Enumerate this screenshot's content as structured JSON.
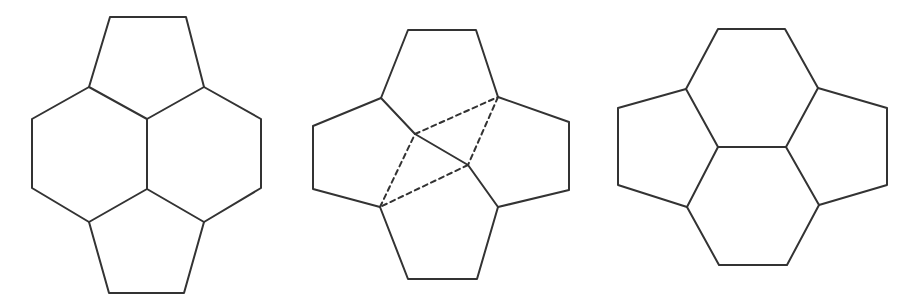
{
  "style": {
    "stroke_color": "#333333",
    "stroke_width": 2,
    "dash_stroke_width": 2,
    "dash_pattern": "5 4",
    "background": "#ffffff"
  },
  "figures": [
    {
      "id": "figure-1",
      "description": "Two pentagons and two hexagons: pentagon top, hexagons left and right, pentagon bottom",
      "solid_polylines": [
        [
          [
            110,
            17
          ],
          [
            186,
            17
          ],
          [
            204,
            87
          ],
          [
            147,
            119
          ],
          [
            89,
            87
          ],
          [
            110,
            17
          ]
        ],
        [
          [
            89,
            87
          ],
          [
            32,
            119
          ],
          [
            32,
            188
          ],
          [
            89,
            222
          ],
          [
            147,
            189
          ],
          [
            147,
            119
          ]
        ],
        [
          [
            204,
            87
          ],
          [
            261,
            119
          ],
          [
            261,
            188
          ],
          [
            204,
            222
          ],
          [
            147,
            189
          ]
        ],
        [
          [
            89,
            222
          ],
          [
            109,
            293
          ],
          [
            184,
            293
          ],
          [
            204,
            222
          ]
        ]
      ],
      "dashed_polylines": []
    },
    {
      "id": "figure-2",
      "description": "Four pentagons arranged around a central rhombus (dashed) with a solid diagonal",
      "solid_polylines": [
        [
          [
            381,
            98
          ],
          [
            408,
            30
          ],
          [
            476,
            30
          ],
          [
            498,
            97
          ]
        ],
        [
          [
            381,
            98
          ],
          [
            313,
            126
          ],
          [
            313,
            189
          ],
          [
            380,
            207
          ]
        ],
        [
          [
            498,
            97
          ],
          [
            569,
            122
          ],
          [
            569,
            190
          ],
          [
            498,
            207
          ]
        ],
        [
          [
            380,
            207
          ],
          [
            408,
            279
          ],
          [
            477,
            279
          ],
          [
            498,
            207
          ]
        ],
        [
          [
            381,
            98
          ],
          [
            415,
            134
          ],
          [
            468,
            165
          ],
          [
            498,
            207
          ]
        ]
      ],
      "dashed_polylines": [
        [
          [
            415,
            134
          ],
          [
            498,
            97
          ]
        ],
        [
          [
            498,
            97
          ],
          [
            468,
            165
          ]
        ],
        [
          [
            468,
            165
          ],
          [
            380,
            207
          ]
        ],
        [
          [
            380,
            207
          ],
          [
            415,
            134
          ]
        ]
      ]
    },
    {
      "id": "figure-3",
      "description": "Two hexagons stacked vertically with pentagons on left and right",
      "solid_polylines": [
        [
          [
            686,
            89
          ],
          [
            718,
            29
          ],
          [
            785,
            29
          ],
          [
            818,
            88
          ],
          [
            786,
            147
          ],
          [
            718,
            147
          ],
          [
            686,
            89
          ]
        ],
        [
          [
            686,
            89
          ],
          [
            618,
            108
          ],
          [
            618,
            185
          ],
          [
            687,
            207
          ],
          [
            718,
            147
          ]
        ],
        [
          [
            818,
            88
          ],
          [
            887,
            108
          ],
          [
            887,
            185
          ],
          [
            819,
            205
          ],
          [
            786,
            147
          ]
        ],
        [
          [
            687,
            207
          ],
          [
            719,
            265
          ],
          [
            787,
            265
          ],
          [
            819,
            205
          ]
        ]
      ],
      "dashed_polylines": []
    }
  ]
}
